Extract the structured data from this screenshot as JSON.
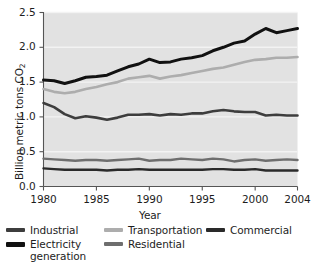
{
  "chart_data": {
    "type": "line",
    "title": "",
    "xlabel": "Year",
    "ylabel": "Billion metric tons CO2",
    "ylabel_html": "Billion metric tons CO₂",
    "xlim": [
      1980,
      2004
    ],
    "ylim": [
      0.0,
      2.5
    ],
    "grid": true,
    "grid_orientation": "horizontal",
    "legend_position": "bottom",
    "plot_background": "#e2e2e2",
    "x": [
      1980,
      1981,
      1982,
      1983,
      1984,
      1985,
      1986,
      1987,
      1988,
      1989,
      1990,
      1991,
      1992,
      1993,
      1994,
      1995,
      1996,
      1997,
      1998,
      1999,
      2000,
      2001,
      2002,
      2003,
      2004
    ],
    "yticks": [
      "0.0",
      "0.5",
      "1.0",
      "1.5",
      "2.0",
      "2.5"
    ],
    "ytick_values": [
      0.0,
      0.5,
      1.0,
      1.5,
      2.0,
      2.5
    ],
    "xticks": [
      "1980",
      "1985",
      "1990",
      "1995",
      "2000",
      "2004"
    ],
    "xtick_values": [
      1980,
      1985,
      1990,
      1995,
      2000,
      2004
    ],
    "series": [
      {
        "name": "Electricity generation",
        "color": "#111111",
        "width": 3.0,
        "values": [
          1.53,
          1.52,
          1.48,
          1.52,
          1.57,
          1.58,
          1.6,
          1.66,
          1.72,
          1.76,
          1.83,
          1.78,
          1.79,
          1.83,
          1.85,
          1.88,
          1.95,
          2.0,
          2.06,
          2.09,
          2.19,
          2.27,
          2.21,
          2.24,
          2.27
        ]
      },
      {
        "name": "Transportation",
        "color": "#adadad",
        "width": 2.6,
        "values": [
          1.4,
          1.36,
          1.34,
          1.36,
          1.4,
          1.43,
          1.47,
          1.5,
          1.55,
          1.57,
          1.59,
          1.55,
          1.58,
          1.6,
          1.63,
          1.66,
          1.69,
          1.71,
          1.75,
          1.79,
          1.82,
          1.83,
          1.85,
          1.85,
          1.86
        ]
      },
      {
        "name": "Industrial",
        "color": "#3d3d3d",
        "width": 2.6,
        "values": [
          1.2,
          1.14,
          1.04,
          0.98,
          1.01,
          0.99,
          0.96,
          0.99,
          1.03,
          1.03,
          1.04,
          1.02,
          1.04,
          1.03,
          1.05,
          1.05,
          1.08,
          1.1,
          1.08,
          1.07,
          1.07,
          1.02,
          1.03,
          1.02,
          1.02
        ]
      },
      {
        "name": "Residential",
        "color": "#6e6e6e",
        "width": 2.4,
        "values": [
          0.4,
          0.39,
          0.38,
          0.37,
          0.38,
          0.38,
          0.37,
          0.38,
          0.39,
          0.4,
          0.37,
          0.38,
          0.38,
          0.4,
          0.39,
          0.38,
          0.4,
          0.39,
          0.36,
          0.38,
          0.39,
          0.37,
          0.38,
          0.39,
          0.38
        ]
      },
      {
        "name": "Commercial",
        "color": "#2a2a2a",
        "width": 2.4,
        "values": [
          0.26,
          0.25,
          0.24,
          0.24,
          0.24,
          0.24,
          0.23,
          0.24,
          0.24,
          0.25,
          0.24,
          0.24,
          0.24,
          0.24,
          0.24,
          0.24,
          0.25,
          0.25,
          0.24,
          0.24,
          0.25,
          0.23,
          0.23,
          0.23,
          0.23
        ]
      }
    ]
  },
  "axes": {
    "ylabel": "Billion metric tons CO",
    "ylabel_sub": "2",
    "xlabel": "Year",
    "yticks": [
      "2.5",
      "2.0",
      "1.5",
      "1.0",
      "0.5",
      "0.0"
    ],
    "xticks": [
      "1980",
      "1985",
      "1990",
      "1995",
      "2000",
      "2004"
    ]
  },
  "legend": {
    "items": [
      {
        "label": "Industrial",
        "label2": "",
        "color": "#3d3d3d",
        "thickness": "4px"
      },
      {
        "label": "Electricity",
        "label2": "generation",
        "color": "#111111",
        "thickness": "5px"
      },
      {
        "label": "Transportation",
        "label2": "",
        "color": "#adadad",
        "thickness": "4px"
      },
      {
        "label": "Residential",
        "label2": "",
        "color": "#6e6e6e",
        "thickness": "4px"
      },
      {
        "label": "Commercial",
        "label2": "",
        "color": "#2a2a2a",
        "thickness": "4px"
      }
    ]
  }
}
